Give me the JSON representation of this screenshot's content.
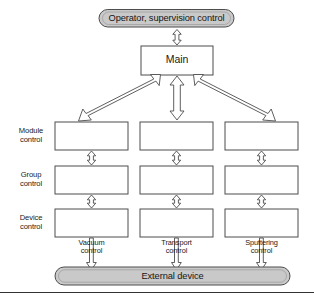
{
  "diagram": {
    "title_node": {
      "label": "Operator, supervision control",
      "shape": "capsule",
      "fill": "#c9c9c9"
    },
    "main_node": {
      "label": "Main",
      "shape": "rectangle",
      "fill": "#ffffff"
    },
    "external_node": {
      "label": "External device",
      "shape": "capsule",
      "fill": "#c9c9c9"
    },
    "row_labels": [
      {
        "id": "module",
        "label": "Module\ncontrol"
      },
      {
        "id": "group",
        "label": "Group\ncontrol"
      },
      {
        "id": "device",
        "label": "Device\ncontrol"
      }
    ],
    "column_labels": [
      {
        "id": "vacuum",
        "label": "Vacuum\ncontrol"
      },
      {
        "id": "transport",
        "label": "Transport\ncontrol"
      },
      {
        "id": "sputtering",
        "label": "Sputtering\ncontrol"
      }
    ],
    "grid_boxes": [
      {
        "row": "module",
        "column": "vacuum",
        "label": ""
      },
      {
        "row": "module",
        "column": "transport",
        "label": ""
      },
      {
        "row": "module",
        "column": "sputtering",
        "label": ""
      },
      {
        "row": "group",
        "column": "vacuum",
        "label": ""
      },
      {
        "row": "group",
        "column": "transport",
        "label": ""
      },
      {
        "row": "group",
        "column": "sputtering",
        "label": ""
      },
      {
        "row": "device",
        "column": "vacuum",
        "label": ""
      },
      {
        "row": "device",
        "column": "transport",
        "label": ""
      },
      {
        "row": "device",
        "column": "sputtering",
        "label": ""
      }
    ],
    "connectors": [
      {
        "id": "operator-main",
        "kind": "double-arrow-vertical"
      },
      {
        "id": "main-module-vacuum",
        "kind": "double-arrow-diagonal"
      },
      {
        "id": "main-module-transport",
        "kind": "double-arrow-vertical-large"
      },
      {
        "id": "main-module-sputtering",
        "kind": "double-arrow-diagonal"
      },
      {
        "id": "module-group-vacuum",
        "kind": "double-arrow-vertical-small"
      },
      {
        "id": "module-group-transport",
        "kind": "double-arrow-vertical-small"
      },
      {
        "id": "module-group-sputtering",
        "kind": "double-arrow-vertical-small"
      },
      {
        "id": "group-device-vacuum",
        "kind": "double-arrow-vertical-small"
      },
      {
        "id": "group-device-transport",
        "kind": "double-arrow-vertical-small"
      },
      {
        "id": "group-device-sputtering",
        "kind": "double-arrow-vertical-small"
      },
      {
        "id": "device-external-vacuum",
        "kind": "single-arrow-down"
      },
      {
        "id": "device-external-transport",
        "kind": "single-arrow-down"
      },
      {
        "id": "device-external-sputtering",
        "kind": "single-arrow-down"
      }
    ],
    "colors": {
      "stroke": "#4d4d4d",
      "node_fill": "#ffffff",
      "capsule_fill": "#c9c9c9",
      "text": "#1a1a1a",
      "footer_rule": "#333333"
    }
  }
}
